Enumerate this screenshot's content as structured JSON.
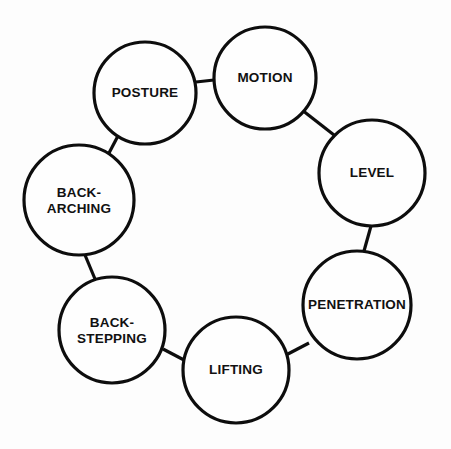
{
  "diagram": {
    "type": "cycle",
    "title": "",
    "background_color": "#fdfdfd",
    "stroke_color": "#0d0d0d",
    "fill_color": "#fefefe",
    "node_count": 7,
    "nodes": [
      {
        "id": "posture",
        "label": "POSTURE",
        "lines": [
          "POSTURE"
        ],
        "cx": 145,
        "cy": 93,
        "r": 51
      },
      {
        "id": "motion",
        "label": "MOTION",
        "lines": [
          "MOTION"
        ],
        "cx": 265,
        "cy": 78,
        "r": 51
      },
      {
        "id": "level",
        "label": "LEVEL",
        "lines": [
          "LEVEL"
        ],
        "cx": 372,
        "cy": 173,
        "r": 53
      },
      {
        "id": "penetration",
        "label": "PENETRATION",
        "lines": [
          "PENETRATION"
        ],
        "cx": 357,
        "cy": 305,
        "r": 54
      },
      {
        "id": "lifting",
        "label": "LIFTING",
        "lines": [
          "LIFTING"
        ],
        "cx": 236,
        "cy": 370,
        "r": 53
      },
      {
        "id": "back-stepping",
        "label": "BACK-STEPPING",
        "lines": [
          "BACK-",
          "STEPPING"
        ],
        "cx": 112,
        "cy": 330,
        "r": 53
      },
      {
        "id": "back-arching",
        "label": "BACK-ARCHING",
        "lines": [
          "BACK-",
          "ARCHING"
        ],
        "cx": 79,
        "cy": 200,
        "r": 55
      }
    ],
    "connectors": [
      {
        "from": "posture",
        "to": "motion",
        "x1": 196,
        "y1": 82,
        "x2": 214,
        "y2": 80
      },
      {
        "from": "motion",
        "to": "level",
        "x1": 302,
        "y1": 110,
        "x2": 334,
        "y2": 135
      },
      {
        "from": "level",
        "to": "penetration",
        "x1": 371,
        "y1": 226,
        "x2": 364,
        "y2": 251
      },
      {
        "from": "penetration",
        "to": "lifting",
        "x1": 309,
        "y1": 343,
        "x2": 286,
        "y2": 355
      },
      {
        "from": "lifting",
        "to": "back-stepping",
        "x1": 184,
        "y1": 360,
        "x2": 163,
        "y2": 349
      },
      {
        "from": "back-stepping",
        "to": "back-arching",
        "x1": 95,
        "y1": 279,
        "x2": 85,
        "y2": 255
      },
      {
        "from": "back-arching",
        "to": "posture",
        "x1": 109,
        "y1": 153,
        "x2": 119,
        "y2": 134
      }
    ]
  }
}
